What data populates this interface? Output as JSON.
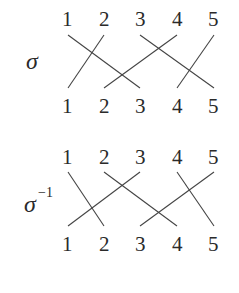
{
  "diagrams": [
    {
      "label": "σ",
      "superscript": "",
      "top_labels": [
        "1",
        "2",
        "3",
        "4",
        "5"
      ],
      "bottom_labels": [
        "1",
        "2",
        "3",
        "4",
        "5"
      ],
      "mapping": {
        "1": "3",
        "2": "1",
        "3": "5",
        "4": "2",
        "5": "4"
      }
    },
    {
      "label": "σ",
      "superscript": "−1",
      "top_labels": [
        "1",
        "2",
        "3",
        "4",
        "5"
      ],
      "bottom_labels": [
        "1",
        "2",
        "3",
        "4",
        "5"
      ],
      "mapping": {
        "1": "2",
        "2": "4",
        "3": "1",
        "4": "5",
        "5": "3"
      }
    }
  ],
  "colors": {
    "line": "#444444",
    "text": "#2a2a2a",
    "background": "#ffffff"
  }
}
